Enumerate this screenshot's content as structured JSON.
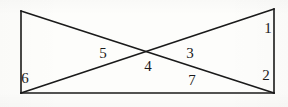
{
  "figure": {
    "kind": "geometry-diagram",
    "canvas": {
      "width": 288,
      "height": 107
    },
    "style": {
      "background_color": "#fdfdfb",
      "ink_color": "#1a1a1a",
      "stroke_width": 1.6
    },
    "vertices": {
      "top_left": {
        "x": 21,
        "y": 11
      },
      "top_right": {
        "x": 274,
        "y": 9
      },
      "bottom_left": {
        "x": 21,
        "y": 93
      },
      "bottom_right": {
        "x": 274,
        "y": 93
      },
      "center": {
        "x": 150,
        "y": 52
      }
    },
    "segments": [
      {
        "name": "left-vertical-edge",
        "from": "top_left",
        "to": "bottom_left"
      },
      {
        "name": "right-vertical-edge",
        "from": "top_right",
        "to": "bottom_right"
      },
      {
        "name": "bottom-baseline",
        "from": "bottom_left",
        "to": "bottom_right"
      },
      {
        "name": "diagonal-tl-to-br",
        "from": "top_left",
        "to": "bottom_right"
      },
      {
        "name": "diagonal-bl-to-tr",
        "from": "bottom_left",
        "to": "top_right"
      }
    ],
    "labels": [
      {
        "id": "angle-1",
        "text": "1",
        "x": 268,
        "y": 28
      },
      {
        "id": "angle-2",
        "text": "2",
        "x": 266,
        "y": 75
      },
      {
        "id": "angle-3",
        "text": "3",
        "x": 190,
        "y": 53
      },
      {
        "id": "angle-4",
        "text": "4",
        "x": 148,
        "y": 66
      },
      {
        "id": "angle-5",
        "text": "5",
        "x": 103,
        "y": 53
      },
      {
        "id": "angle-6",
        "text": "6",
        "x": 25,
        "y": 78
      },
      {
        "id": "angle-7",
        "text": "7",
        "x": 192,
        "y": 80
      }
    ]
  }
}
